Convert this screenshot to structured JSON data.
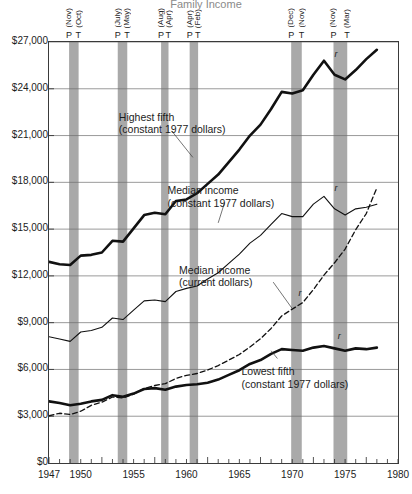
{
  "chart_data": {
    "type": "line",
    "title": "Family Income",
    "xlabel": "",
    "ylabel": "",
    "xlim": [
      1947,
      1980
    ],
    "ylim": [
      0,
      27000
    ],
    "ytick_labels": [
      "$0",
      "$3,000",
      "$6,000",
      "$9,000",
      "$12,000",
      "$15,000",
      "$18,000",
      "$21,000",
      "$24,000",
      "$27,000"
    ],
    "ytick_values": [
      0,
      3000,
      6000,
      9000,
      12000,
      15000,
      18000,
      21000,
      24000,
      27000
    ],
    "xtick_labels": [
      "1947",
      "1950",
      "1955",
      "1960",
      "1965",
      "1970",
      "1975",
      "1980"
    ],
    "xtick_values": [
      1947,
      1950,
      1955,
      1960,
      1965,
      1970,
      1975,
      1980
    ],
    "grid": true,
    "legend_position": "inline-annotations",
    "series": [
      {
        "name": "Highest fifth (constant 1977 dollars)",
        "style": "solid-thick",
        "x": [
          1947,
          1948,
          1949,
          1950,
          1951,
          1952,
          1953,
          1954,
          1955,
          1956,
          1957,
          1958,
          1959,
          1960,
          1961,
          1962,
          1963,
          1964,
          1965,
          1966,
          1967,
          1968,
          1969,
          1970,
          1971,
          1972,
          1973,
          1974,
          1975,
          1976,
          1977,
          1978
        ],
        "y": [
          12900,
          12750,
          12700,
          13300,
          13350,
          13500,
          14250,
          14200,
          15050,
          15900,
          16050,
          15950,
          16800,
          16900,
          17300,
          17900,
          18500,
          19300,
          20100,
          21000,
          21700,
          22700,
          23800,
          23700,
          23900,
          24900,
          25800,
          24900,
          24600,
          25200,
          25900,
          26500
        ]
      },
      {
        "name": "Median income (constant 1977 dollars)",
        "style": "solid-thin",
        "x": [
          1947,
          1948,
          1949,
          1950,
          1951,
          1952,
          1953,
          1954,
          1955,
          1956,
          1957,
          1958,
          1959,
          1960,
          1961,
          1962,
          1963,
          1964,
          1965,
          1966,
          1967,
          1968,
          1969,
          1970,
          1971,
          1972,
          1973,
          1974,
          1975,
          1976,
          1977,
          1978
        ],
        "y": [
          8100,
          7950,
          7800,
          8400,
          8500,
          8700,
          9300,
          9200,
          9800,
          10400,
          10450,
          10350,
          11000,
          11200,
          11350,
          11800,
          12200,
          12800,
          13400,
          14100,
          14600,
          15300,
          16000,
          15800,
          15800,
          16600,
          17100,
          16300,
          15900,
          16300,
          16400,
          16600
        ]
      },
      {
        "name": "Median income (current dollars)",
        "style": "dashed",
        "x": [
          1947,
          1948,
          1949,
          1950,
          1951,
          1952,
          1953,
          1954,
          1955,
          1956,
          1957,
          1958,
          1959,
          1960,
          1961,
          1962,
          1963,
          1964,
          1965,
          1966,
          1967,
          1968,
          1969,
          1970,
          1971,
          1972,
          1973,
          1974,
          1975,
          1976,
          1977,
          1978
        ],
        "y": [
          3030,
          3190,
          3110,
          3320,
          3700,
          3900,
          4230,
          4170,
          4420,
          4780,
          4970,
          5090,
          5420,
          5620,
          5740,
          5960,
          6250,
          6600,
          6960,
          7440,
          7970,
          8630,
          9430,
          9870,
          10290,
          11120,
          12050,
          12840,
          13720,
          14960,
          16000,
          17640
        ]
      },
      {
        "name": "Lowest fifth (constant 1977 dollars)",
        "style": "solid-thick",
        "x": [
          1947,
          1948,
          1949,
          1950,
          1951,
          1952,
          1953,
          1954,
          1955,
          1956,
          1957,
          1958,
          1959,
          1960,
          1961,
          1962,
          1963,
          1964,
          1965,
          1966,
          1967,
          1968,
          1969,
          1970,
          1971,
          1972,
          1973,
          1974,
          1975,
          1976,
          1977,
          1978
        ],
        "y": [
          3950,
          3850,
          3700,
          3800,
          3950,
          4050,
          4350,
          4250,
          4450,
          4750,
          4800,
          4700,
          4900,
          5000,
          5050,
          5150,
          5350,
          5650,
          5950,
          6350,
          6600,
          7000,
          7300,
          7250,
          7200,
          7400,
          7500,
          7350,
          7200,
          7350,
          7300,
          7400
        ]
      }
    ],
    "recessions": [
      {
        "peak_label": "(Nov)",
        "trough_label": "(Oct)",
        "peak_mark": "P",
        "trough_mark": "T",
        "peak_year": 1948.9,
        "trough_year": 1949.8
      },
      {
        "peak_label": "(July)",
        "trough_label": "(May)",
        "peak_mark": "P",
        "trough_mark": "T",
        "peak_year": 1953.5,
        "trough_year": 1954.4
      },
      {
        "peak_label": "(Aug)",
        "trough_label": "(Apr)",
        "peak_mark": "P",
        "trough_mark": "T",
        "peak_year": 1957.6,
        "trough_year": 1958.3
      },
      {
        "peak_label": "(Apr)",
        "trough_label": "(Feb)",
        "peak_mark": "P",
        "trough_mark": "T",
        "peak_year": 1960.3,
        "trough_year": 1961.1
      },
      {
        "peak_label": "(Dec)",
        "trough_label": "(Nov)",
        "peak_mark": "P",
        "trough_mark": "T",
        "peak_year": 1969.9,
        "trough_year": 1970.9
      },
      {
        "peak_label": "(Nov)",
        "trough_label": "(Mar)",
        "peak_mark": "P",
        "trough_mark": "T",
        "peak_year": 1973.9,
        "trough_year": 1975.2
      }
    ],
    "annotations": [
      {
        "name": "highest-fifth",
        "line1": "Highest fifth",
        "line2": "(constant 1977 dollars)",
        "x": 1953.6,
        "y": 22200
      },
      {
        "name": "median-constant",
        "line1": "Median income",
        "line2": "(constant 1977 dollars)",
        "x": 1958.2,
        "y": 17500
      },
      {
        "name": "median-current",
        "line1": "Median income",
        "line2": "(current dollars)",
        "x": 1959.3,
        "y": 12400
      },
      {
        "name": "lowest-fifth",
        "line1": "Lowest fifth",
        "line2": "(constant 1977 dollars)",
        "x": 1965.2,
        "y": 5900
      }
    ],
    "revision_marks": [
      {
        "label": "r",
        "x": 1974.0,
        "y": 25900
      },
      {
        "label": "r",
        "x": 1974.0,
        "y": 17300
      },
      {
        "label": "r",
        "x": 1970.6,
        "y": 10600
      },
      {
        "label": "r",
        "x": 1974.3,
        "y": 7850
      }
    ],
    "colors": {
      "band": "#a9a9a9",
      "grid": "#6f6f6f",
      "frame": "#3a3a3a",
      "line": "#111111",
      "text": "#1c1c1c"
    }
  }
}
